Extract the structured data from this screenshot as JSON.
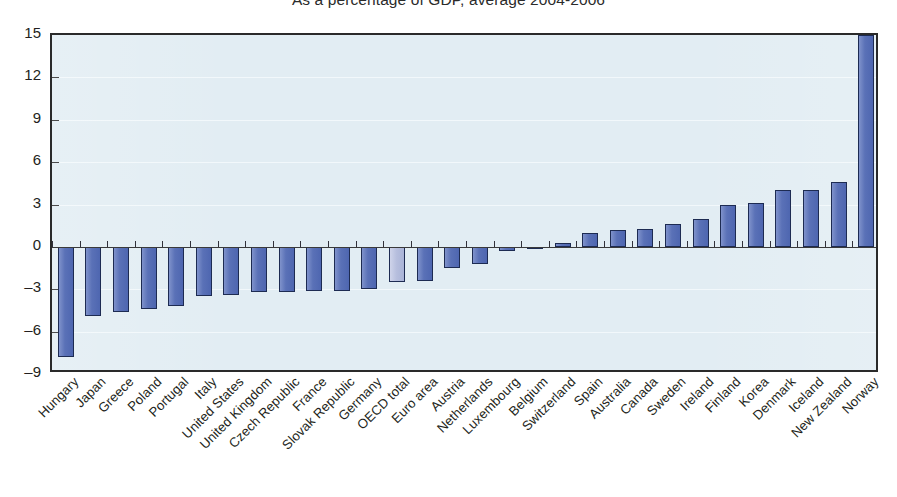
{
  "chart_data": {
    "type": "bar",
    "title": "As a percentage of GDP, average 2004-2006",
    "xlabel": "",
    "ylabel": "",
    "ylim": [
      -9,
      15
    ],
    "yticks": [
      15,
      12,
      9,
      6,
      3,
      0,
      -3,
      -6,
      -9
    ],
    "ytick_labels": [
      "15",
      "12",
      "9",
      "6",
      "3",
      "0",
      "-3",
      "-6",
      "-9"
    ],
    "grid": true,
    "legend": "none",
    "orientation": "vertical",
    "bar_color": "#5a71b7",
    "bar_border_color": "#1d2b52",
    "highlight_color": "#b6bedd",
    "plot_background": "#e2edf3",
    "highlight_category": "OECD total",
    "categories": [
      "Hungary",
      "Japan",
      "Greece",
      "Poland",
      "Portugal",
      "Italy",
      "United States",
      "United Kingdom",
      "Czech Republic",
      "France",
      "Slovak Republic",
      "Germany",
      "OECD total",
      "Euro area",
      "Austria",
      "Netherlands",
      "Luxembourg",
      "Belgium",
      "Switzerland",
      "Spain",
      "Australia",
      "Canada",
      "Sweden",
      "Ireland",
      "Finland",
      "Korea",
      "Denmark",
      "Iceland",
      "New Zealand",
      "Norway"
    ],
    "values": [
      -7.8,
      -4.9,
      -4.6,
      -4.4,
      -4.2,
      -3.5,
      -3.4,
      -3.2,
      -3.2,
      -3.1,
      -3.1,
      -3.0,
      -2.5,
      -2.4,
      -1.5,
      -1.2,
      -0.3,
      -0.1,
      0.3,
      1.0,
      1.2,
      1.3,
      1.6,
      2.0,
      3.0,
      3.1,
      4.0,
      4.0,
      4.6,
      15.0
    ]
  }
}
